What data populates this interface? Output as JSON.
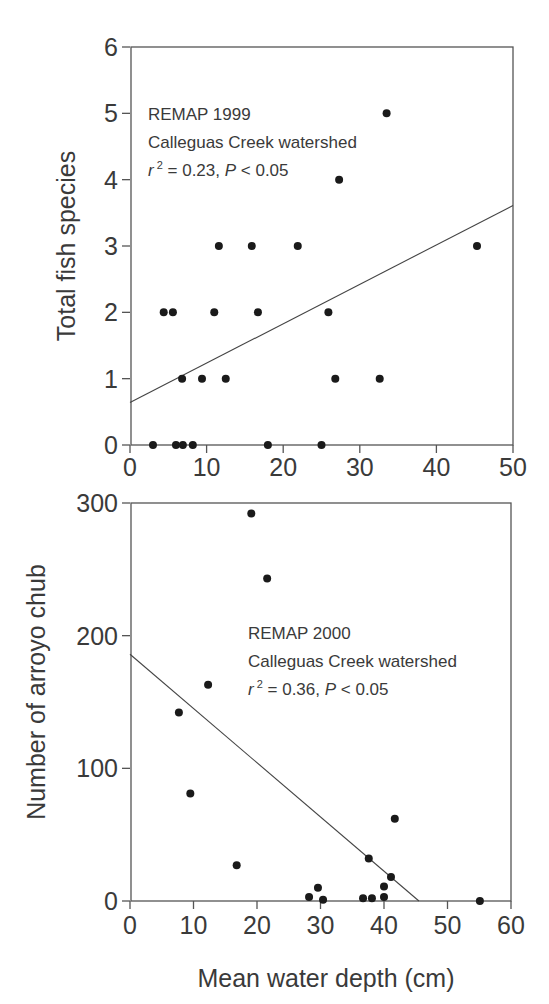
{
  "chart_data": [
    {
      "type": "scatter",
      "panel": "top",
      "title": "",
      "annotation": [
        "REMAP 1999",
        "Calleguas Creek watershed",
        "r 2 = 0.23, P < 0.05"
      ],
      "annotation_parts": {
        "line1": "REMAP 1999",
        "line2": "Calleguas Creek watershed",
        "r": "r",
        "sup": "2",
        "stat": " = 0.23, ",
        "p": "P",
        "pval": " < 0.05"
      },
      "xlabel": "",
      "ylabel": "Total fish species",
      "xlim": [
        0,
        50
      ],
      "ylim": [
        0,
        6
      ],
      "xticks": [
        0,
        10,
        20,
        30,
        40,
        50
      ],
      "yticks": [
        0,
        1,
        2,
        3,
        4,
        5,
        6
      ],
      "grid": false,
      "points": [
        {
          "x": 3.0,
          "y": 0
        },
        {
          "x": 6.0,
          "y": 0
        },
        {
          "x": 6.9,
          "y": 0
        },
        {
          "x": 8.2,
          "y": 0
        },
        {
          "x": 18.0,
          "y": 0
        },
        {
          "x": 25.0,
          "y": 0
        },
        {
          "x": 6.8,
          "y": 1
        },
        {
          "x": 9.4,
          "y": 1
        },
        {
          "x": 12.5,
          "y": 1
        },
        {
          "x": 26.8,
          "y": 1
        },
        {
          "x": 32.6,
          "y": 1
        },
        {
          "x": 4.4,
          "y": 2
        },
        {
          "x": 5.6,
          "y": 2
        },
        {
          "x": 11.0,
          "y": 2
        },
        {
          "x": 16.7,
          "y": 2
        },
        {
          "x": 25.9,
          "y": 2
        },
        {
          "x": 11.6,
          "y": 3
        },
        {
          "x": 15.9,
          "y": 3
        },
        {
          "x": 21.9,
          "y": 3
        },
        {
          "x": 45.3,
          "y": 3
        },
        {
          "x": 27.3,
          "y": 4
        },
        {
          "x": 33.5,
          "y": 5
        }
      ],
      "regression": {
        "x0": 0,
        "y0": 0.64,
        "x1": 50,
        "y1": 3.61
      }
    },
    {
      "type": "scatter",
      "panel": "bottom",
      "title": "",
      "annotation": [
        "REMAP 2000",
        "Calleguas Creek watershed",
        "r 2 = 0.36, P < 0.05"
      ],
      "annotation_parts": {
        "line1": "REMAP 2000",
        "line2": "Calleguas Creek watershed",
        "r": "r",
        "sup": "2",
        "stat": " = 0.36, ",
        "p": "P",
        "pval": " < 0.05"
      },
      "xlabel": "Mean water depth (cm)",
      "ylabel": "Number of arroyo chub",
      "xlim": [
        0,
        60
      ],
      "ylim": [
        0,
        300
      ],
      "xticks": [
        0,
        10,
        20,
        30,
        40,
        50,
        60
      ],
      "yticks": [
        0,
        100,
        200,
        300
      ],
      "grid": false,
      "points": [
        {
          "x": 19.1,
          "y": 292
        },
        {
          "x": 21.6,
          "y": 243
        },
        {
          "x": 12.3,
          "y": 163
        },
        {
          "x": 7.7,
          "y": 142
        },
        {
          "x": 9.5,
          "y": 81
        },
        {
          "x": 16.8,
          "y": 27
        },
        {
          "x": 41.7,
          "y": 62
        },
        {
          "x": 37.6,
          "y": 32
        },
        {
          "x": 41.1,
          "y": 18
        },
        {
          "x": 29.6,
          "y": 10
        },
        {
          "x": 40.0,
          "y": 11
        },
        {
          "x": 28.2,
          "y": 3
        },
        {
          "x": 30.4,
          "y": 1
        },
        {
          "x": 36.7,
          "y": 2
        },
        {
          "x": 38.1,
          "y": 2
        },
        {
          "x": 40.0,
          "y": 3
        },
        {
          "x": 55.1,
          "y": 0
        }
      ],
      "regression": {
        "x0": 0,
        "y0": 186,
        "x1": 45.5,
        "y1": 0
      }
    }
  ]
}
